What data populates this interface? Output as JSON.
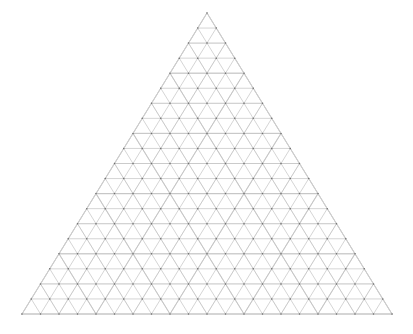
{
  "figure": {
    "type": "triangular-grid-diagram",
    "background_color": "#ffffff"
  },
  "geometry": {
    "apex": {
      "x": 207,
      "y": 13
    },
    "bottom_left": {
      "x": 22,
      "y": 314
    },
    "bottom_right": {
      "x": 392,
      "y": 314
    },
    "subdivisions": 20,
    "rows": 20,
    "row_height": 15.05,
    "cell_width": 18.5,
    "base_width": 370,
    "height": 301,
    "orientation": "apex-up"
  },
  "levels": [
    {
      "name": "fine-grid",
      "subdivisions": 20,
      "stroke_color": "#b9b9b9",
      "stroke_width": 0.6,
      "opacity": 1
    },
    {
      "name": "coarse-overlay-grid",
      "subdivisions": 5,
      "stroke_color": "#dcdcdc",
      "stroke_width": 1.1,
      "opacity": 0.85
    },
    {
      "name": "medium-overlay-grid",
      "subdivisions": 10,
      "stroke_color": "#d2d2d2",
      "stroke_width": 0.8,
      "opacity": 0.7
    }
  ],
  "vertices": {
    "name": "lattice-vertex-dots",
    "color": "#6e6e6e",
    "radius": 0.75,
    "shape": "circle",
    "count": 231
  },
  "outline": {
    "name": "triangle-outline",
    "stroke_color": "#cfcfcf",
    "stroke_width": 0.7
  },
  "legend": {
    "visible": false,
    "entries": []
  },
  "axes": {
    "visible": false,
    "tick_labels": []
  },
  "annotations": [],
  "chart_data": {
    "type": "diagram",
    "title": "",
    "subtitle": "",
    "xlabel": "",
    "ylabel": "",
    "series": [
      {
        "name": "fine-grid-lines",
        "direction_sets": [
          "horizontal",
          "left-diagonal",
          "right-diagonal"
        ],
        "lines_per_direction": 21,
        "total_lines": 63
      }
    ],
    "categories": [
      "horizontal",
      "left-diagonal",
      "right-diagonal"
    ],
    "values": [
      21,
      21,
      21
    ],
    "grid": true,
    "legend_position": "none"
  }
}
